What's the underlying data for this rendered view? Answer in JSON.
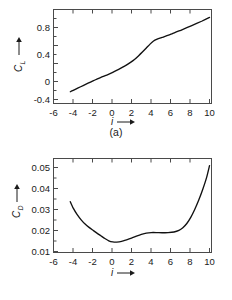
{
  "figure": {
    "background": "#ffffff",
    "line_color": "#111111",
    "axis_color": "#4a4a4a"
  },
  "panels": [
    {
      "id": "a",
      "caption": "(a)",
      "ylabel": "C",
      "ylabel_sub": "L",
      "xlabel": "i",
      "xticks": [
        "-6",
        "-4",
        "-2",
        "0",
        "2",
        "4",
        "6",
        "8",
        "10"
      ],
      "yticks": [
        "-0.4",
        "0",
        "0.4",
        "0.8"
      ]
    },
    {
      "id": "b",
      "caption": "(b)",
      "ylabel": "C",
      "ylabel_sub": "D",
      "xlabel": "i",
      "xticks": [
        "-6",
        "-4",
        "-2",
        "0",
        "2",
        "4",
        "6",
        "8",
        "10"
      ],
      "yticks": [
        "0.01",
        "0.02",
        "0.03",
        "0.04",
        "0.05"
      ]
    }
  ],
  "chart_data": [
    {
      "type": "line",
      "panel": "a",
      "title": "",
      "xlabel": "i",
      "ylabel": "C_L",
      "xlim": [
        -6,
        10
      ],
      "ylim": [
        -0.62,
        0.98
      ],
      "xticks": [
        -6,
        -4,
        -2,
        0,
        2,
        4,
        6,
        8,
        10
      ],
      "yticks": [
        -0.4,
        0,
        0.4,
        0.8
      ],
      "grid": false,
      "legend": "none",
      "series": [
        {
          "name": "C_L",
          "x": [
            -4.3,
            -4.0,
            -3.5,
            -3.0,
            -2.5,
            -2.0,
            -1.6,
            -1.2,
            -0.6,
            0.0,
            0.6,
            1.2,
            1.8,
            2.2,
            2.6,
            3.0,
            3.4,
            3.8,
            4.1,
            4.5,
            5.0,
            6.0,
            7.0,
            8.0,
            9.0,
            9.8
          ],
          "y": [
            -0.42,
            -0.395,
            -0.355,
            -0.315,
            -0.275,
            -0.235,
            -0.205,
            -0.175,
            -0.135,
            -0.09,
            -0.04,
            0.015,
            0.08,
            0.13,
            0.19,
            0.255,
            0.325,
            0.395,
            0.44,
            0.475,
            0.505,
            0.565,
            0.635,
            0.705,
            0.78,
            0.845
          ]
        }
      ]
    },
    {
      "type": "line",
      "panel": "b",
      "title": "",
      "xlabel": "i",
      "ylabel": "C_D",
      "xlim": [
        -6,
        10
      ],
      "ylim": [
        0.0065,
        0.0555
      ],
      "xticks": [
        -6,
        -4,
        -2,
        0,
        2,
        4,
        6,
        8,
        10
      ],
      "yticks": [
        0.01,
        0.02,
        0.03,
        0.04,
        0.05
      ],
      "grid": false,
      "legend": "none",
      "series": [
        {
          "name": "C_D",
          "x": [
            -4.3,
            -4.0,
            -3.6,
            -3.2,
            -2.8,
            -2.4,
            -2.0,
            -1.6,
            -1.2,
            -0.8,
            -0.4,
            0.0,
            0.4,
            0.9,
            1.4,
            1.9,
            2.4,
            2.9,
            3.4,
            3.9,
            4.4,
            5.0,
            5.6,
            6.2,
            6.7,
            7.1,
            7.5,
            7.9,
            8.3,
            8.7,
            9.1,
            9.5,
            9.8
          ],
          "y": [
            0.033,
            0.0296,
            0.0262,
            0.0235,
            0.0213,
            0.0196,
            0.0181,
            0.0166,
            0.0152,
            0.0138,
            0.0126,
            0.012,
            0.0119,
            0.0123,
            0.0131,
            0.014,
            0.015,
            0.0159,
            0.0166,
            0.0169,
            0.0169,
            0.0168,
            0.0169,
            0.0172,
            0.018,
            0.0194,
            0.0216,
            0.0248,
            0.0289,
            0.0337,
            0.0392,
            0.0455,
            0.0518
          ]
        }
      ]
    }
  ]
}
